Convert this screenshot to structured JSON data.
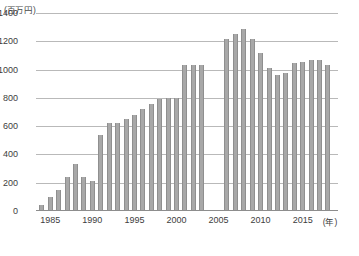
{
  "chart_data": {
    "type": "bar",
    "title": "",
    "subtitle": "",
    "xlabel": "(年)",
    "ylabel": "(百万円)",
    "unit_label": "(百万円)",
    "xaxis_unit": "(年)",
    "ylim": [
      0,
      1400
    ],
    "ytick_values": [
      0,
      200,
      400,
      600,
      800,
      1000,
      1200,
      1400
    ],
    "ytick_labels": [
      "0",
      "200",
      "400",
      "600",
      "800",
      "1000",
      "1200",
      "1400"
    ],
    "xtick_labels": [
      "1985",
      "1990",
      "1995",
      "2000",
      "2005",
      "2010",
      "2015"
    ],
    "xtick_values": [
      1985,
      1990,
      1995,
      2000,
      2005,
      2010,
      2015
    ],
    "xlim": [
      1983.3,
      2019.2
    ],
    "grid": true,
    "legend": false,
    "bar_color": "#a8a8a8",
    "bar_edge_color": "#8f8f8f",
    "grid_color": "#b9b9b9",
    "categories": [
      1984,
      1985,
      1986,
      1987,
      1988,
      1989,
      1990,
      1991,
      1992,
      1993,
      1994,
      1995,
      1996,
      1997,
      1998,
      1999,
      2000,
      2001,
      2002,
      2003,
      2006,
      2007,
      2008,
      2009,
      2010,
      2011,
      2012,
      2013,
      2014,
      2015,
      2016,
      2017,
      2018
    ],
    "values": [
      40,
      100,
      150,
      240,
      330,
      240,
      215,
      540,
      625,
      620,
      650,
      680,
      720,
      755,
      790,
      800,
      800,
      1030,
      1030,
      1030,
      1215,
      1250,
      1290,
      1215,
      1120,
      1010,
      960,
      975,
      1045,
      1055,
      1070,
      1070,
      1035
    ],
    "missing_years": [
      2004,
      2005
    ],
    "caption": ""
  }
}
